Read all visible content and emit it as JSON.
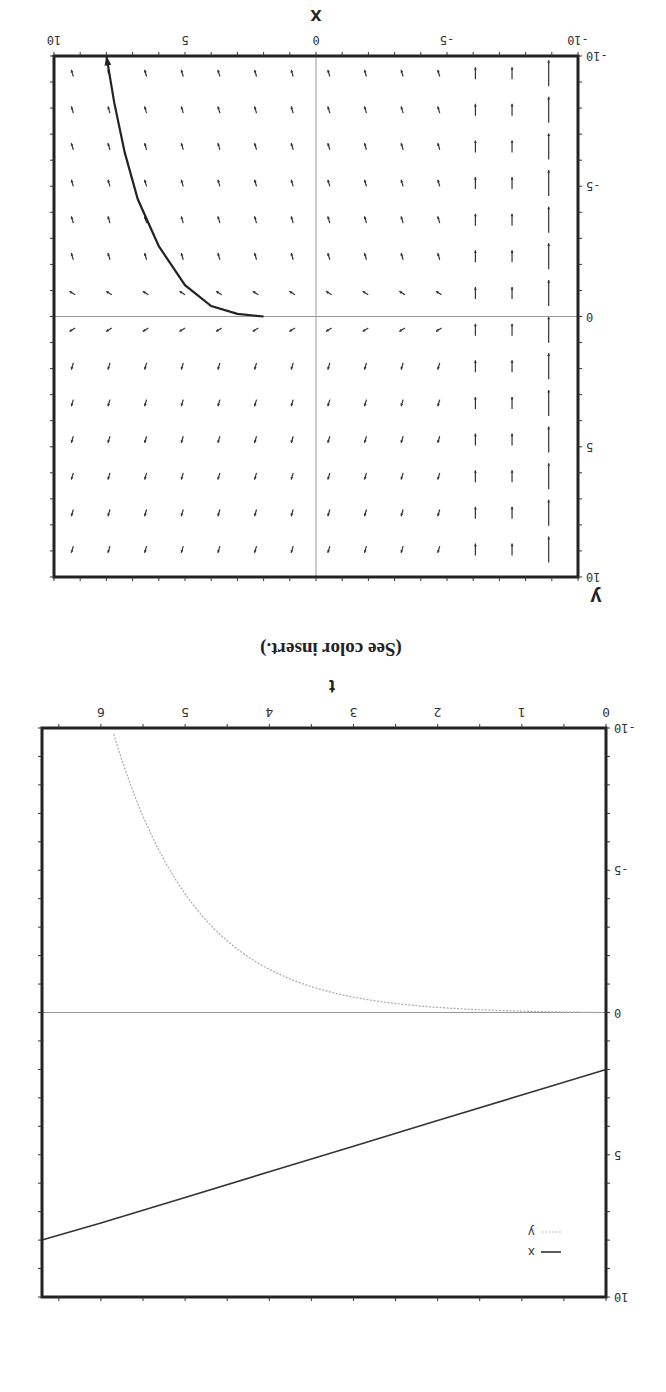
{
  "figure": {
    "rotation_deg": 180,
    "caption": "(See color insert.)"
  },
  "chart_data": [
    {
      "type": "line",
      "name": "time-series",
      "title": "",
      "xlabel": "t",
      "ylabel": "",
      "xlim": [
        0,
        6.7
      ],
      "ylim": [
        -10,
        10
      ],
      "x_ticks": [
        "0",
        "1",
        "2",
        "3",
        "4",
        "5",
        "6"
      ],
      "y_ticks": [
        "-10",
        "-5",
        "0",
        "5",
        "10"
      ],
      "grid": false,
      "zero_line": true,
      "legend": {
        "position": "lower-left",
        "entries": [
          "x",
          "y"
        ]
      },
      "series": [
        {
          "name": "x",
          "style": "solid-dark",
          "x": [
            0,
            1,
            2,
            3,
            4,
            5,
            6,
            6.7
          ],
          "values": [
            2.0,
            2.9,
            3.8,
            4.7,
            5.6,
            6.5,
            7.4,
            8.0
          ]
        },
        {
          "name": "y",
          "style": "dotted-light",
          "x": [
            0,
            1,
            2,
            3,
            4,
            5,
            5.5,
            5.85
          ],
          "values": [
            0.0,
            -0.05,
            -0.2,
            -0.7,
            -2.0,
            -5.0,
            -7.8,
            -10.0
          ]
        }
      ]
    },
    {
      "type": "vector_field",
      "name": "phase-plane",
      "title": "",
      "xlabel": "x",
      "ylabel": "y",
      "xlim": [
        -10,
        10
      ],
      "ylim": [
        -10,
        10
      ],
      "x_ticks": [
        "-10",
        "-5",
        "0",
        "5",
        "10"
      ],
      "y_ticks": [
        "-10",
        "-5",
        "0",
        "5",
        "10"
      ],
      "grid": false,
      "axes_lines": true,
      "grid_spacing": 1.4,
      "trajectory": {
        "description": "solution curve starting near (2, 0) moving toward x≈8, y→-10",
        "x": [
          2.0,
          3.0,
          4.0,
          5.0,
          6.0,
          6.8,
          7.3,
          7.7,
          8.0
        ],
        "y": [
          0.0,
          -0.1,
          -0.4,
          -1.2,
          -2.7,
          -4.5,
          -6.3,
          -8.2,
          -10.0
        ]
      }
    }
  ]
}
